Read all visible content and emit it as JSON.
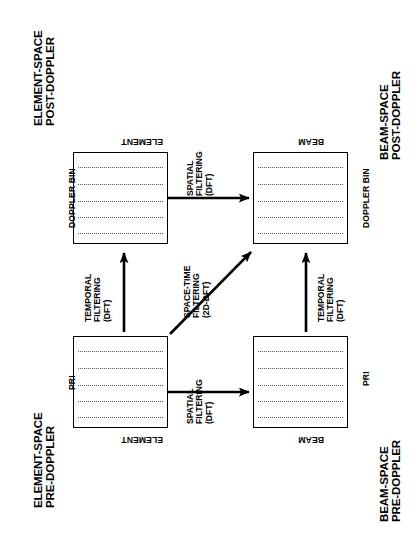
{
  "figure": {
    "type": "diagram",
    "background": "#ffffff",
    "ink": "#000000",
    "orientation": "page rotated 90 degrees; all text reads sideways"
  },
  "corner_labels": [
    {
      "id": "top-left",
      "line1": "ELEMENT-SPACE",
      "line2": "POST-DOPPLER"
    },
    {
      "id": "top-right",
      "line1": "BEAM-SPACE",
      "line2": "POST-DOPPLER"
    },
    {
      "id": "bottom-left",
      "line1": "ELEMENT-SPACE",
      "line2": "PRE-DOPPLER"
    },
    {
      "id": "bottom-right",
      "line1": "BEAM-SPACE",
      "line2": "PRE-DOPPLER"
    }
  ],
  "cubes": [
    {
      "id": "element-space-post-doppler",
      "side_axis": "DOPPLER BIN",
      "edge_axis": "ELEMENT",
      "rows": 5
    },
    {
      "id": "beam-space-post-doppler",
      "side_axis": "DOPPLER BIN",
      "edge_axis": "BEAM",
      "rows": 5
    },
    {
      "id": "element-space-pre-doppler",
      "side_axis": "PRI",
      "edge_axis": "ELEMENT",
      "rows": 5
    },
    {
      "id": "beam-space-pre-doppler",
      "side_axis": "PRI",
      "edge_axis": "BEAM",
      "rows": 5
    }
  ],
  "arrows": [
    {
      "id": "spatial-filtering-top",
      "line1": "SPATIAL",
      "line2": "FILTERING",
      "line3": "(DFT)",
      "from": "element-space-post-doppler",
      "to": "beam-space-post-doppler"
    },
    {
      "id": "spatial-filtering-bottom",
      "line1": "SPATIAL",
      "line2": "FILTERING",
      "line3": "(DFT)",
      "from": "element-space-pre-doppler",
      "to": "beam-space-pre-doppler"
    },
    {
      "id": "temporal-filtering-left",
      "line1": "TEMPORAL",
      "line2": "FILTERING",
      "line3": "(DFT)",
      "from": "element-space-pre-doppler",
      "to": "element-space-post-doppler"
    },
    {
      "id": "temporal-filtering-right",
      "line1": "TEMPORAL",
      "line2": "FILTERING",
      "line3": "(DFT)",
      "from": "beam-space-pre-doppler",
      "to": "beam-space-post-doppler"
    },
    {
      "id": "space-time-filtering-diagonal",
      "line1": "SPACE-TIME",
      "line2": "FILTERING",
      "line3": "(2D-DFT)",
      "from": "element-space-pre-doppler",
      "to": "beam-space-post-doppler"
    }
  ]
}
